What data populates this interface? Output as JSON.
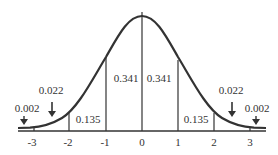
{
  "diagram": {
    "x_ticks": [
      "-3",
      "-2",
      "-1",
      "0",
      "1",
      "2",
      "3"
    ],
    "regions": [
      {
        "id": "left-tail-3",
        "label": "0.002",
        "arrow": true
      },
      {
        "id": "left-2-3",
        "label": "0.022",
        "arrow": true
      },
      {
        "id": "left-1-2",
        "label": "0.135"
      },
      {
        "id": "left-0-1",
        "label": "0.341"
      },
      {
        "id": "right-0-1",
        "label": "0.341"
      },
      {
        "id": "right-1-2",
        "label": "0.135"
      },
      {
        "id": "right-2-3",
        "label": "0.022",
        "arrow": true
      },
      {
        "id": "right-tail-3",
        "label": "0.002",
        "arrow": true
      }
    ],
    "colors": {
      "line": "#333333",
      "background": "#ffffff"
    }
  }
}
